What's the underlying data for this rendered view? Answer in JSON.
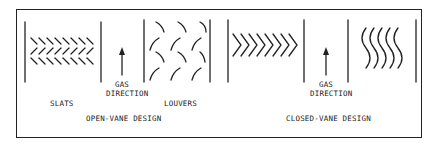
{
  "figure": {
    "panels": [
      {
        "id": "open-vane",
        "title": "OPEN-VANE DESIGN",
        "left_label": "SLATS",
        "right_label": "LOUVERS",
        "flow_label_1": "GAS",
        "flow_label_2": "DIRECTION"
      },
      {
        "id": "closed-vane",
        "title": "CLOSED-VANE DESIGN",
        "flow_label_1": "GAS",
        "flow_label_2": "DIRECTION"
      }
    ],
    "colors": {
      "ink": "#222222",
      "background": "#ffffff"
    }
  }
}
